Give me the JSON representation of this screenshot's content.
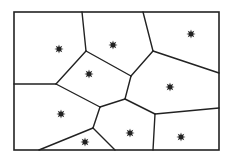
{
  "diagram": {
    "type": "voronoi",
    "colors": {
      "line": "#222222",
      "seed": "#222222",
      "background": "#ffffff"
    },
    "border": {
      "x": 14,
      "y": 12,
      "width": 205,
      "height": 138
    },
    "vertices": {
      "T1": [
        82,
        12
      ],
      "T2": [
        143,
        12
      ],
      "A": [
        86,
        51
      ],
      "B": [
        153,
        51
      ],
      "L1": [
        14,
        84
      ],
      "C": [
        56,
        84
      ],
      "D": [
        131,
        76
      ],
      "R1": [
        219,
        73
      ],
      "E": [
        100,
        107
      ],
      "F": [
        125,
        99
      ],
      "G": [
        93,
        128
      ],
      "H": [
        155,
        114
      ],
      "R2": [
        219,
        108
      ],
      "B1": [
        39,
        150
      ],
      "B2": [
        115,
        150
      ],
      "B3": [
        153,
        150
      ]
    },
    "edges": [
      [
        "T1",
        "A"
      ],
      [
        "T2",
        "B"
      ],
      [
        "A",
        "C"
      ],
      [
        "A",
        "D"
      ],
      [
        "C",
        "L1"
      ],
      [
        "B",
        "D"
      ],
      [
        "B",
        "R1"
      ],
      [
        "C",
        "E"
      ],
      [
        "D",
        "F"
      ],
      [
        "E",
        "F"
      ],
      [
        "E",
        "G"
      ],
      [
        "G",
        "B1"
      ],
      [
        "G",
        "B2"
      ],
      [
        "F",
        "H"
      ],
      [
        "H",
        "R2"
      ],
      [
        "H",
        "B3"
      ]
    ],
    "seeds": [
      {
        "id": 1,
        "x": 59,
        "y": 49
      },
      {
        "id": 2,
        "x": 113,
        "y": 45
      },
      {
        "id": 3,
        "x": 191,
        "y": 34
      },
      {
        "id": 4,
        "x": 89,
        "y": 74
      },
      {
        "id": 5,
        "x": 170,
        "y": 87
      },
      {
        "id": 6,
        "x": 61,
        "y": 114
      },
      {
        "id": 7,
        "x": 130,
        "y": 133
      },
      {
        "id": 8,
        "x": 85,
        "y": 142
      },
      {
        "id": 9,
        "x": 181,
        "y": 137
      }
    ]
  }
}
